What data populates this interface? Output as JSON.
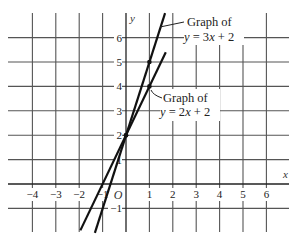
{
  "chart_data": {
    "type": "line",
    "title": "",
    "xlabel": "x",
    "ylabel": "y",
    "origin_label": "O",
    "xlim": [
      -5,
      7
    ],
    "ylim": [
      -2,
      7
    ],
    "grid": true,
    "x_ticks": [
      -4,
      -3,
      -2,
      -1,
      1,
      2,
      3,
      4,
      5,
      6
    ],
    "x_tick_labels": [
      "−4",
      "−3",
      "−2",
      "−1",
      "1",
      "2",
      "3",
      "4",
      "5",
      "6"
    ],
    "y_ticks": [
      -1,
      1,
      2,
      3,
      4,
      5,
      6
    ],
    "y_tick_labels": [
      "−1",
      "1",
      "2",
      "3",
      "4",
      "5",
      "6"
    ],
    "series": [
      {
        "name": "y = 3x + 2",
        "slope": 3,
        "intercept": 2,
        "x": [
          -1.33,
          1.67
        ],
        "y": [
          -2,
          7
        ],
        "marked_points": [
          [
            0,
            2
          ],
          [
            1,
            5
          ]
        ]
      },
      {
        "name": "y = 2x + 2",
        "slope": 2,
        "intercept": 2,
        "x": [
          -1.95,
          1.7
        ],
        "y": [
          -1.9,
          5.4
        ],
        "marked_points": [
          [
            0,
            2
          ],
          [
            1,
            4
          ]
        ]
      }
    ],
    "annotations": [
      {
        "line1": "Graph of",
        "line2": "y = 3x + 2",
        "points_to": "y = 3x + 2"
      },
      {
        "line1": "Graph of",
        "line2": "y = 2x + 2",
        "points_to": "y = 2x + 2"
      }
    ]
  }
}
